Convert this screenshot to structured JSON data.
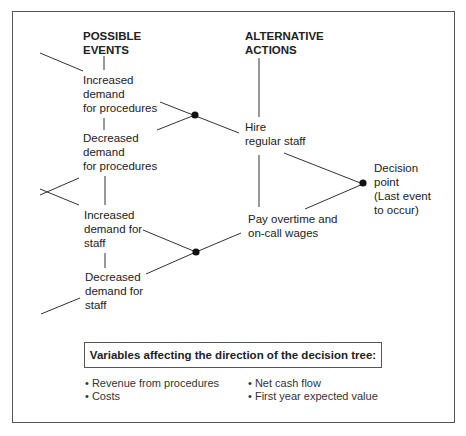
{
  "headers": {
    "events": "POSSIBLE\nEVENTS",
    "actions": "ALTERNATIVE\nACTIONS"
  },
  "events": [
    {
      "label": "Increased\ndemand\nfor procedures"
    },
    {
      "label": "Decreased\ndemand\nfor procedures"
    },
    {
      "label": "Increased\ndemand for\nstaff"
    },
    {
      "label": "Decreased\ndemand for\nstaff"
    }
  ],
  "actions": [
    {
      "label": "Hire\nregular staff"
    },
    {
      "label": "Pay overtime and\non-call wages"
    }
  ],
  "decision_point": {
    "label": "Decision\npoint\n(Last event\nto occur)"
  },
  "variables": {
    "title": "Variables affecting the direction of the decision tree:",
    "items_left": [
      "• Revenue from procedures",
      "• Costs"
    ],
    "items_right": [
      "• Net cash flow",
      "• First year expected value"
    ]
  },
  "colors": {
    "line": "#333333",
    "node": "#111111",
    "border": "#555555"
  }
}
